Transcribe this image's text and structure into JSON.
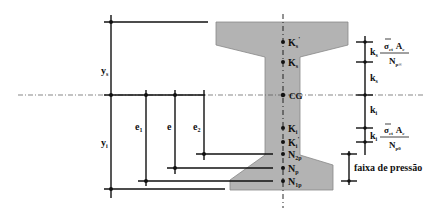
{
  "figure": {
    "type": "prestressed I-beam cross-section with core/kern and pressure band",
    "section_fill": "#b3b3b3",
    "line_color": "#111111"
  },
  "dimensions": {
    "ys": "y",
    "ys_sub": "s",
    "yi": "y",
    "yi_sub": "i",
    "e1": "e",
    "e1_sub": "1",
    "e": "e",
    "e2": "e",
    "e2_sub": "2"
  },
  "axis_points": [
    {
      "main": "K",
      "sub": "s",
      "sup": "'"
    },
    {
      "main": "K",
      "sub": "s",
      "sup": ""
    },
    {
      "main": "CG",
      "sub": "",
      "sup": ""
    },
    {
      "main": "K",
      "sub": "i",
      "sup": ""
    },
    {
      "main": "K",
      "sub": "i",
      "sup": "'"
    },
    {
      "main": "N",
      "sub": "2p",
      "sup": ""
    },
    {
      "main": "N",
      "sub": "p",
      "sup": ""
    },
    {
      "main": "N",
      "sub": "1p",
      "sup": ""
    }
  ],
  "right_dims": {
    "upper_k": "k",
    "upper_k_sub": "s",
    "upper_sigma": "σ",
    "upper_sigma_sub": "ct",
    "upper_A": "A",
    "upper_A_sub": "c",
    "upper_N": "N",
    "upper_N_sub": "p∞",
    "ks": "k",
    "ks_sub": "s",
    "ki": "k",
    "ki_sub": "i",
    "lower_k": "k",
    "lower_k_sub": "i",
    "lower_sigma": "σ",
    "lower_sigma_sub": "ct",
    "lower_A": "A",
    "lower_A_sub": "c",
    "lower_N": "N",
    "lower_N_sub": "p0"
  },
  "pressure_band_label": "faixa de pressão"
}
